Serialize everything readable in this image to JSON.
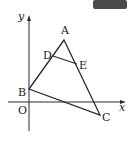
{
  "figure": {
    "axes": {
      "x_label": "x",
      "y_label": "y",
      "origin_label": "O"
    },
    "points": {
      "A": {
        "label": "A",
        "px": [
          64,
          40
        ]
      },
      "B": {
        "label": "B",
        "px": [
          29,
          89
        ]
      },
      "C": {
        "label": "C",
        "px": [
          100,
          115
        ]
      },
      "D": {
        "label": "D",
        "px": [
          53,
          56
        ]
      },
      "E": {
        "label": "E",
        "px": [
          77,
          64
        ]
      }
    },
    "segments": [
      "AB",
      "BC",
      "CA",
      "DE"
    ],
    "colors": {
      "line": "#2a2a2a",
      "corner_badge": "#4a4a4a"
    }
  }
}
